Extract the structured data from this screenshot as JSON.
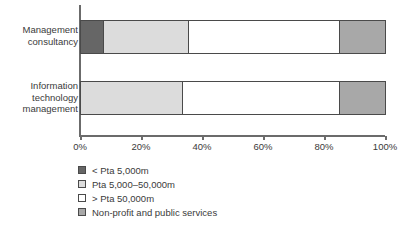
{
  "chart_data": {
    "type": "bar",
    "orientation": "horizontal",
    "stacked": true,
    "normalized": true,
    "title": "",
    "subtitle": "",
    "xlabel": "",
    "ylabel": "",
    "xlim": [
      0,
      100
    ],
    "grid": false,
    "legend_position": "bottom-left",
    "xtick_labels": [
      "0%",
      "20%",
      "40%",
      "60%",
      "80%",
      "100%"
    ],
    "xtick_values": [
      0,
      20,
      40,
      60,
      80,
      100
    ],
    "categories": [
      "Management consultancy",
      "Information technology management"
    ],
    "series": [
      {
        "name": "< Pta 5,000m",
        "color": "#666666",
        "values": [
          7.5,
          0
        ]
      },
      {
        "name": "Pta 5,000–50,000m",
        "color": "#dcdcdc",
        "values": [
          28.0,
          33.5
        ]
      },
      {
        "name": "> Pta 50,000m",
        "color": "#ffffff",
        "values": [
          49.5,
          51.5
        ]
      },
      {
        "name": "Non-profit and public services",
        "color": "#a8a8a8",
        "values": [
          15.0,
          15.0
        ]
      }
    ]
  },
  "legend": {
    "items": [
      {
        "label": "< Pta 5,000m",
        "color": "#666666"
      },
      {
        "label": "Pta 5,000–50,000m",
        "color": "#dcdcdc"
      },
      {
        "label": "> Pta 50,000m",
        "color": "#ffffff"
      },
      {
        "label": "Non-profit and public services",
        "color": "#a8a8a8"
      }
    ]
  },
  "axis": {
    "line_color": "#6b6b6b",
    "text_color": "#3a3a3a"
  }
}
